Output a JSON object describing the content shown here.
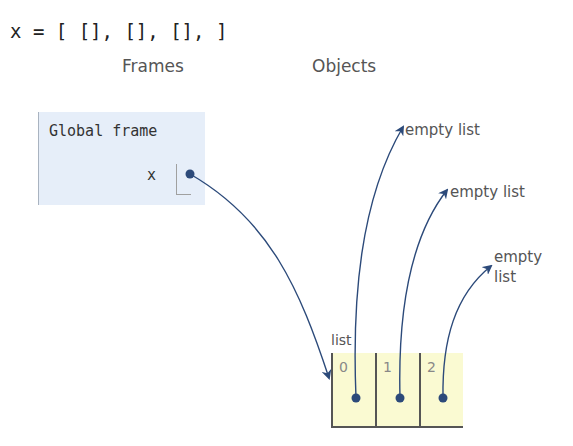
{
  "code": {
    "line": "x = [ [], [], [], ]"
  },
  "headings": {
    "frames": "Frames",
    "objects": "Objects"
  },
  "global_frame": {
    "title": "Global frame",
    "variables": [
      {
        "name": "x",
        "value": "pointer-to-list"
      }
    ]
  },
  "list_object": {
    "type_label": "list",
    "cells": [
      {
        "index": "0",
        "value": "pointer-to-empty-list"
      },
      {
        "index": "1",
        "value": "pointer-to-empty-list"
      },
      {
        "index": "2",
        "value": "pointer-to-empty-list"
      }
    ]
  },
  "empty_lists": [
    {
      "label": "empty list"
    },
    {
      "label": "empty list"
    },
    {
      "label_line1": "empty",
      "label_line2": "list"
    }
  ],
  "colors": {
    "arrow": "#2c4a7a",
    "frame_bg": "#e6eef9",
    "list_bg": "#fafad2"
  }
}
